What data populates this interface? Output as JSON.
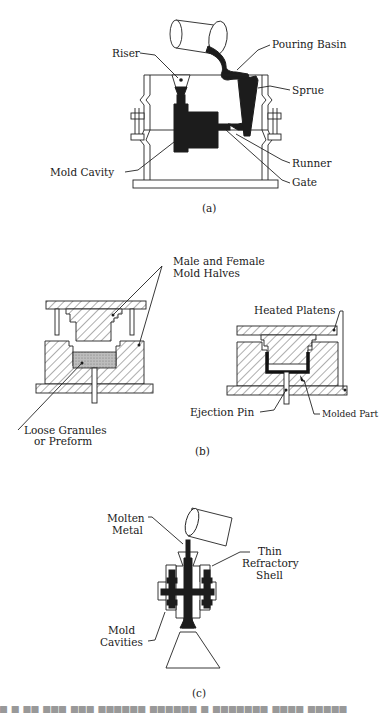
{
  "figure": {
    "panels": [
      {
        "id": "a",
        "caption": "(a)",
        "title": "Sand casting mold",
        "labels": {
          "riser": "Riser",
          "pouring_basin": "Pouring Basin",
          "sprue": "Sprue",
          "mold_cavity": "Mold Cavity",
          "runner": "Runner",
          "gate": "Gate"
        }
      },
      {
        "id": "b",
        "caption": "(b)",
        "title": "Compression molding",
        "labels": {
          "mold_halves_line1": "Male and Female",
          "mold_halves_line2": "Mold Halves",
          "heated_platens": "Heated Platens",
          "loose_granules_line1": "Loose Granules",
          "loose_granules_line2": "or Preform",
          "ejection_pin": "Ejection Pin",
          "molded_part": "Molded Part"
        }
      },
      {
        "id": "c",
        "caption": "(c)",
        "title": "Investment casting",
        "labels": {
          "molten_metal_line1": "Molten",
          "molten_metal_line2": "Metal",
          "thin_shell_line1": "Thin",
          "thin_shell_line2": "Refractory",
          "thin_shell_line3": "Shell",
          "mold_cavities_line1": "Mold",
          "mold_cavities_line2": "Cavities"
        }
      }
    ],
    "colors": {
      "ink": "#1c1c1c",
      "background": "#ffffff",
      "stipple": "#9a9a9a"
    }
  }
}
